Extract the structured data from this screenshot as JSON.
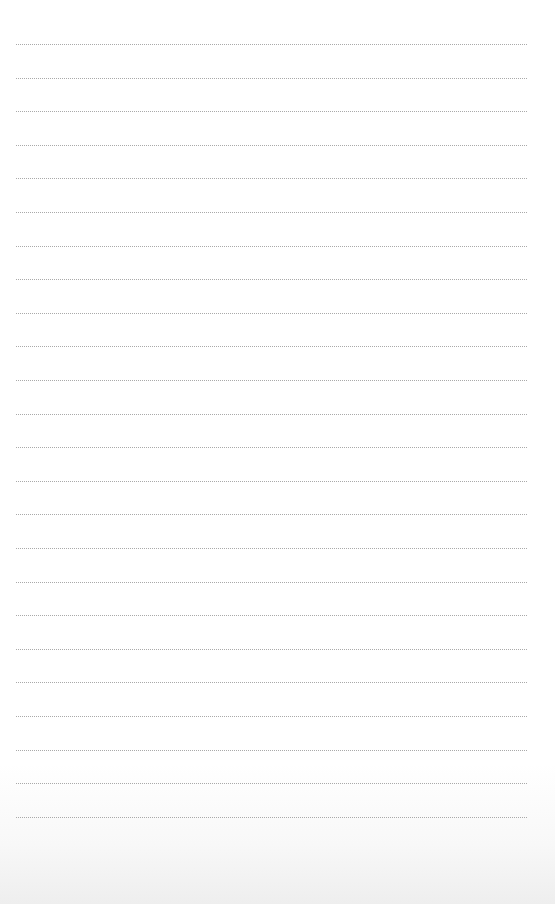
{
  "page": {
    "type": "ruled-paper",
    "line_color": "#a9a9a9",
    "line_style": "dotted",
    "line_left": 16,
    "line_right": 527,
    "first_line_y": 44,
    "line_spacing": 33.6,
    "line_count": 24
  }
}
